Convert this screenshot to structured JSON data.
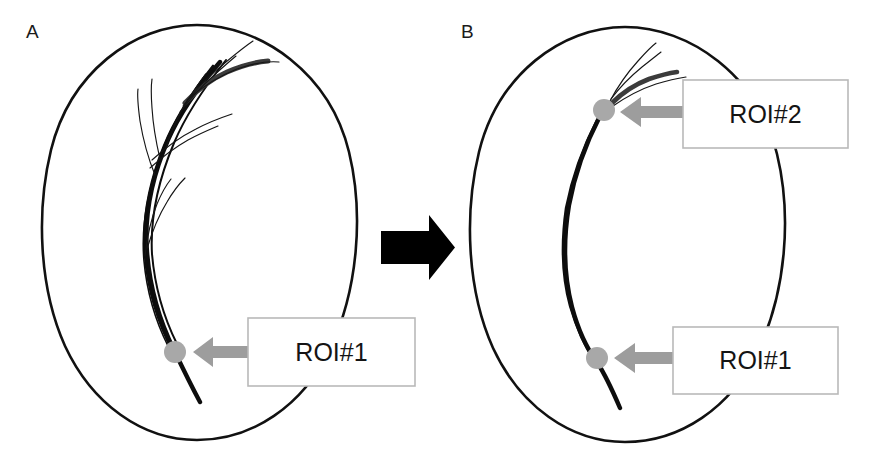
{
  "figure": {
    "background_color": "#ffffff",
    "width": 871,
    "height": 451
  },
  "panels": [
    {
      "id": "panel-a",
      "label": "A",
      "label_x": 26,
      "label_y": 38,
      "brain_outline": {
        "center_x": 200,
        "center_y": 233,
        "radius_x": 155,
        "radius_y": 208,
        "stroke_color": "#111111"
      },
      "fiber_count_description": "full bundle with fanning branches",
      "rois": [
        {
          "name": "ROI#1",
          "label": "ROI#1",
          "dot_x": 175,
          "dot_y": 352,
          "dot_radius": 11,
          "dot_color": "#a8a8a8",
          "box_x": 248,
          "box_y": 318,
          "box_width": 167,
          "box_height": 68,
          "arrow_color": "#9d9d9d",
          "arrow_direction": "left"
        }
      ]
    },
    {
      "id": "panel-b",
      "label": "B",
      "label_x": 461,
      "label_y": 38,
      "brain_outline": {
        "center_x": 628,
        "center_y": 234,
        "radius_x": 156,
        "radius_y": 208,
        "stroke_color": "#111111"
      },
      "fiber_count_description": "single tract passing through both ROIs",
      "rois": [
        {
          "name": "ROI#2",
          "label": "ROI#2",
          "dot_x": 604,
          "dot_y": 110,
          "dot_radius": 11,
          "dot_color": "#a8a8a8",
          "box_x": 683,
          "box_y": 80,
          "box_width": 165,
          "box_height": 68,
          "arrow_color": "#9d9d9d",
          "arrow_direction": "left"
        },
        {
          "name": "ROI#1",
          "label": "ROI#1",
          "dot_x": 597,
          "dot_y": 358,
          "dot_radius": 11,
          "dot_color": "#a8a8a8",
          "box_x": 673,
          "box_y": 327,
          "box_width": 165,
          "box_height": 67,
          "arrow_color": "#9d9d9d",
          "arrow_direction": "left"
        }
      ]
    }
  ],
  "transition_arrow": {
    "name": "black-transition-arrow",
    "color": "#000000",
    "direction": "right",
    "x": 381,
    "y": 215,
    "width": 74,
    "height": 65
  },
  "colors": {
    "outline": "#111111",
    "tract_dark": "#0d0d0d",
    "tract_mid": "#3b3b3b",
    "roi_dot": "#a8a8a8",
    "roi_arrow": "#9d9d9d",
    "roi_box_border": "#b9b9b9",
    "text": "#141414",
    "background": "#ffffff"
  }
}
